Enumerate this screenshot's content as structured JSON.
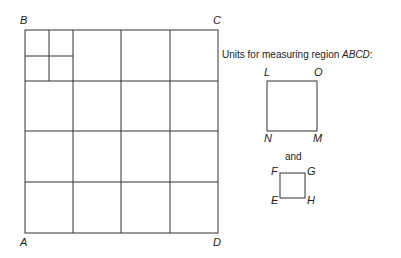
{
  "region": {
    "corners": {
      "top_left": "B",
      "top_right": "C",
      "bottom_left": "A",
      "bottom_right": "D"
    },
    "grid": {
      "rows": 4,
      "cols": 4,
      "subdivided_cell": "top-left",
      "subdivision": "2x2"
    }
  },
  "caption": {
    "prefix": "Units for measuring region ",
    "region_name": "ABCD",
    "suffix": ":"
  },
  "large_unit": {
    "top_left": "L",
    "top_right": "O",
    "bottom_left": "N",
    "bottom_right": "M"
  },
  "connector": "and",
  "small_unit": {
    "top_left": "F",
    "top_right": "G",
    "bottom_left": "E",
    "bottom_right": "H"
  }
}
